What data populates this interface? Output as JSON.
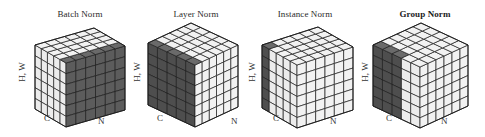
{
  "figure": {
    "background": "#ffffff",
    "colors": {
      "light_cell": "#f2f2f2",
      "light_cell_side": "#ececec",
      "dark_cell": "#5c5c5c",
      "dark_cell_side": "#4e4e4e",
      "dark_cell_top": "#6a6a6a",
      "grid_line": "#1e1e1e"
    },
    "axis_labels": {
      "hw": "H, W",
      "c": "C",
      "n": "N"
    },
    "panels": [
      {
        "title": "Batch Norm",
        "bold": false,
        "title_pos": [
          80,
          9
        ],
        "geometry": {
          "left_top": [
            35,
            45
          ],
          "front_top": [
            66,
            63
          ],
          "right_top": [
            125,
            46
          ],
          "height": 64
        },
        "grid": {
          "c": 5,
          "n": 6,
          "hw": 6
        },
        "highlight": {
          "face": "n",
          "desc": "all N face dark",
          "c_range": [
            0,
            1
          ],
          "n_range": [
            0,
            6
          ],
          "top_c_range": [
            5,
            5
          ]
        },
        "labels": {
          "hw": [
            22,
            72
          ],
          "c": [
            47,
            118
          ],
          "n": [
            101,
            121
          ]
        }
      },
      {
        "title": "Layer Norm",
        "bold": false,
        "title_pos": [
          196,
          9
        ],
        "geometry": {
          "left_top": [
            148,
            43
          ],
          "front_top": [
            195,
            65
          ],
          "right_top": [
            238,
            45
          ],
          "height": 62
        },
        "grid": {
          "c": 5,
          "n": 6,
          "hw": 6
        },
        "highlight": {
          "face": "c",
          "desc": "all C face dark",
          "c_range": [
            0,
            5
          ],
          "n_range": [
            0,
            0
          ]
        },
        "labels": {
          "hw": [
            137,
            72
          ],
          "c": [
            160,
            118
          ],
          "n": [
            234,
            121
          ]
        }
      },
      {
        "title": "Instance Norm",
        "bold": false,
        "title_pos": [
          305,
          9
        ],
        "geometry": {
          "left_top": [
            262,
            45
          ],
          "front_top": [
            297,
            65
          ],
          "right_top": [
            353,
            47
          ],
          "height": 63
        },
        "grid": {
          "c": 5,
          "n": 6,
          "hw": 6
        },
        "highlight": {
          "face": "c",
          "desc": "last C column dark",
          "c_range": [
            4,
            5
          ],
          "n_range": [
            0,
            0
          ]
        },
        "labels": {
          "hw": [
            252,
            72
          ],
          "c": [
            276,
            118
          ],
          "n": [
            333,
            121
          ]
        }
      },
      {
        "title": "Group Norm",
        "bold": true,
        "title_pos": [
          425,
          9
        ],
        "geometry": {
          "left_top": [
            373,
            45
          ],
          "front_top": [
            420,
            67
          ],
          "right_top": [
            468,
            45
          ],
          "height": 61
        },
        "grid": {
          "c": 5,
          "n": 6,
          "hw": 6
        },
        "highlight": {
          "face": "c",
          "desc": "C columns 3-5 dark",
          "c_range": [
            2,
            5
          ],
          "n_range": [
            0,
            0
          ]
        },
        "labels": {
          "hw": [
            365,
            72
          ],
          "c": [
            389,
            118
          ],
          "n": [
            444,
            121
          ]
        }
      }
    ]
  }
}
